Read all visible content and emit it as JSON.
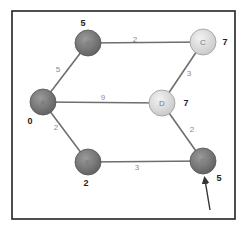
{
  "diagram": {
    "type": "weighted-graph",
    "colors": {
      "visited_node": "#7d7d7d",
      "unvisited_node": "#e0e0e0",
      "edge": "#6e6e6e",
      "frame": "#222222"
    },
    "nodes": [
      {
        "id": "A",
        "label": "A",
        "x": 43,
        "y": 102,
        "state": "visited",
        "distance": "0",
        "dist_x": 30,
        "dist_y": 122
      },
      {
        "id": "B",
        "label": "B",
        "x": 88,
        "y": 43,
        "state": "visited",
        "distance": "5",
        "dist_x": 83,
        "dist_y": 24
      },
      {
        "id": "C",
        "label": "C",
        "x": 203,
        "y": 42,
        "state": "unvisited",
        "distance": "7",
        "dist_x": 225,
        "dist_y": 43
      },
      {
        "id": "D",
        "label": "D",
        "x": 162,
        "y": 103,
        "state": "unvisited",
        "distance": "7",
        "dist_x": 186,
        "dist_y": 104
      },
      {
        "id": "E",
        "label": "E",
        "x": 88,
        "y": 162,
        "state": "visited",
        "distance": "2",
        "dist_x": 86,
        "dist_y": 184
      },
      {
        "id": "F",
        "label": "F",
        "x": 203,
        "y": 161,
        "state": "visited",
        "distance": "5",
        "dist_x": 219,
        "dist_y": 179
      }
    ],
    "edges": [
      {
        "from": "A",
        "to": "B",
        "weight": "5",
        "label_x": 58,
        "label_y": 70
      },
      {
        "from": "B",
        "to": "C",
        "weight": "2",
        "label_x": 135,
        "label_y": 40
      },
      {
        "from": "A",
        "to": "D",
        "weight": "9",
        "label_x": 103,
        "label_y": 98
      },
      {
        "from": "C",
        "to": "D",
        "weight": "3",
        "label_x": 189,
        "label_y": 74
      },
      {
        "from": "A",
        "to": "E",
        "weight": "2",
        "label_x": 56,
        "label_y": 128
      },
      {
        "from": "D",
        "to": "F",
        "weight": "2",
        "label_x": 192,
        "label_y": 130
      },
      {
        "from": "E",
        "to": "F",
        "weight": "3",
        "label_x": 137,
        "label_y": 168
      }
    ],
    "pointer_arrow": {
      "target": "F",
      "x1": 210,
      "y1": 210,
      "x2": 205,
      "y2": 180
    }
  }
}
